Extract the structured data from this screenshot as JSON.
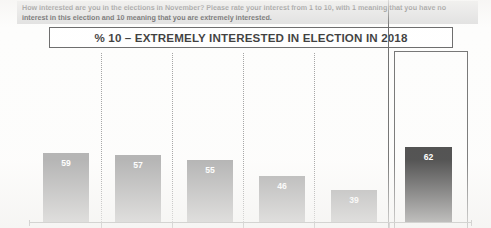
{
  "question": {
    "line1": "How interested are you in the elections in November? Please rate your interest from 1 to 10, with 1 meaning that you have no",
    "line2": "interest in this election and 10 meaning that you are extremely interested."
  },
  "title": "% 10 – EXTREMELY INTERESTED IN ELECTION IN 2018",
  "colors": {
    "bar": "#9e9e9e",
    "bar_highlight": "#1d1d1d",
    "banner": "#d9d9d9",
    "value_label": "#ffffff",
    "frame": "#555555"
  },
  "chart_data": {
    "type": "bar",
    "title": "% 10 – EXTREMELY INTERESTED IN ELECTION IN 2018",
    "xlabel": "",
    "ylabel": "",
    "ylim": [
      0,
      70
    ],
    "grid": false,
    "legend": "none",
    "categories": [
      "",
      "",
      "",
      "",
      "",
      ""
    ],
    "values": [
      59,
      57,
      55,
      46,
      39,
      62
    ],
    "labels": [
      "59",
      "57",
      "55",
      "46",
      "39",
      "62"
    ],
    "highlight_index": 5,
    "series": [
      {
        "name": "% rating 10 - extremely interested",
        "values": [
          59,
          57,
          55,
          46,
          39,
          62
        ]
      }
    ]
  },
  "bars": [
    {
      "value": "59",
      "left": 43,
      "width": 46,
      "height": 69
    },
    {
      "value": "57",
      "left": 115,
      "width": 46,
      "height": 67
    },
    {
      "value": "55",
      "left": 187,
      "width": 46,
      "height": 62
    },
    {
      "value": "46",
      "left": 259,
      "width": 46,
      "height": 46
    },
    {
      "value": "39",
      "left": 331,
      "width": 46,
      "height": 32
    },
    {
      "value": "62",
      "left": 405,
      "width": 47,
      "height": 75
    }
  ],
  "separators": [
    101,
    172,
    243,
    314
  ],
  "axis_ticks": [
    101,
    172,
    243,
    314,
    389
  ]
}
